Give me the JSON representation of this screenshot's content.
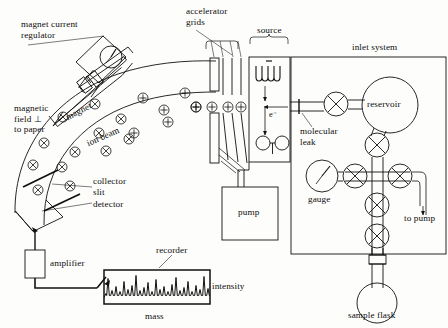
{
  "diagram": {
    "stroke_color": "#111111",
    "background_color": "#fdfdfb"
  },
  "labels": {
    "magnet_current_regulator": "magnet current\nregulator",
    "magnetic_field": "magnetic\nfield ⊥\nto paper",
    "magnet": "magnet",
    "ion_beam": "ion beam",
    "collector_slit": "collector\nslit",
    "detector": "detector",
    "amplifier": "amplifier",
    "recorder": "recorder",
    "intensity": "intensity",
    "mass": "mass",
    "accelerator_grids": "accelerator\ngrids",
    "source": "source",
    "electron": "e⁻",
    "pump": "pump",
    "molecular_leak": "molecular\nleak",
    "inlet_system": "inlet system",
    "reservoir": "reservoir",
    "gauge": "gauge",
    "to_pump": "to pump",
    "sample_flask": "sample flask"
  },
  "charges": {
    "into_page_symbol": "⊗",
    "out_of_page_symbol": "⊕",
    "positive_symbol": "+",
    "negative_symbol": "−"
  },
  "field_markers_into_page": [
    {
      "x": 63,
      "y": 117
    },
    {
      "x": 95,
      "y": 104
    },
    {
      "x": 121,
      "y": 119
    },
    {
      "x": 129,
      "y": 139
    },
    {
      "x": 99,
      "y": 133
    },
    {
      "x": 75,
      "y": 152
    },
    {
      "x": 44,
      "y": 143
    },
    {
      "x": 33,
      "y": 165
    },
    {
      "x": 62,
      "y": 167
    },
    {
      "x": 70,
      "y": 186
    },
    {
      "x": 38,
      "y": 190
    },
    {
      "x": 106,
      "y": 151
    }
  ],
  "field_markers_out_of_page": [
    {
      "x": 143,
      "y": 98
    },
    {
      "x": 134,
      "y": 133
    },
    {
      "x": 164,
      "y": 110
    },
    {
      "x": 185,
      "y": 93
    },
    {
      "x": 168,
      "y": 122
    },
    {
      "x": 196,
      "y": 107
    }
  ],
  "accel_charges": [
    {
      "x": 196,
      "y": 107
    },
    {
      "x": 212,
      "y": 107
    },
    {
      "x": 228,
      "y": 107
    },
    {
      "x": 241,
      "y": 107
    }
  ],
  "ion_optics_negative": [
    {
      "x": 263,
      "y": 143
    },
    {
      "x": 282,
      "y": 143
    }
  ],
  "valves": [
    {
      "x": 336,
      "y": 104,
      "name": "leak-valve"
    },
    {
      "x": 377,
      "y": 145,
      "name": "reservoir-valve"
    },
    {
      "x": 355,
      "y": 176,
      "name": "gauge-valve"
    },
    {
      "x": 400,
      "y": 176,
      "name": "pump-valve"
    },
    {
      "x": 377,
      "y": 205,
      "name": "cross-valve"
    },
    {
      "x": 377,
      "y": 236,
      "name": "flask-valve"
    }
  ],
  "recorder_trace": {
    "baseline": 295.5,
    "peaks": [
      {
        "x": 108,
        "h": 17
      },
      {
        "x": 112,
        "h": 5
      },
      {
        "x": 116,
        "h": 9
      },
      {
        "x": 120,
        "h": 4
      },
      {
        "x": 124,
        "h": 14
      },
      {
        "x": 128,
        "h": 6
      },
      {
        "x": 132,
        "h": 10
      },
      {
        "x": 136,
        "h": 20
      },
      {
        "x": 140,
        "h": 5
      },
      {
        "x": 144,
        "h": 8
      },
      {
        "x": 148,
        "h": 13
      },
      {
        "x": 152,
        "h": 4
      },
      {
        "x": 156,
        "h": 16
      },
      {
        "x": 160,
        "h": 6
      },
      {
        "x": 164,
        "h": 9
      },
      {
        "x": 168,
        "h": 4
      },
      {
        "x": 172,
        "h": 11
      },
      {
        "x": 176,
        "h": 18
      },
      {
        "x": 180,
        "h": 5
      },
      {
        "x": 184,
        "h": 8
      },
      {
        "x": 188,
        "h": 14
      },
      {
        "x": 192,
        "h": 4
      },
      {
        "x": 196,
        "h": 10
      },
      {
        "x": 200,
        "h": 6
      },
      {
        "x": 204,
        "h": 19
      },
      {
        "x": 208,
        "h": 7
      }
    ]
  }
}
